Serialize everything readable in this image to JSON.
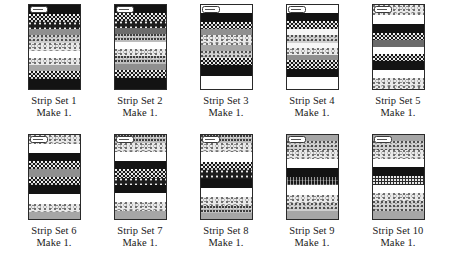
{
  "page": {
    "background_color": "#ffffff",
    "ink_color": "#1a1a1a",
    "columns": 5,
    "rows": 2
  },
  "strip_sets": [
    {
      "id": 1,
      "label": "Strip Set 1",
      "make": "Make 1.",
      "tag_icon": "fabric-tag-icon",
      "bands": [
        {
          "pattern": "solid-dark",
          "name": "black solid",
          "height_pct": 11,
          "color": "#131313"
        },
        {
          "pattern": "dot-dark",
          "name": "black dotted",
          "height_pct": 9,
          "color": "#171717"
        },
        {
          "pattern": "dot-dark2",
          "name": "black dotted",
          "height_pct": 8,
          "color": "#1d1d1d"
        },
        {
          "pattern": "gray-solid",
          "name": "medium gray solid",
          "height_pct": 8,
          "color": "#8f8f8f"
        },
        {
          "pattern": "stipple-mid",
          "name": "gray stipple",
          "height_pct": 9,
          "color": "#cfcfcf"
        },
        {
          "pattern": "stipple-light",
          "name": "light stipple",
          "height_pct": 10,
          "color": "#e9e9e9"
        },
        {
          "pattern": "white",
          "name": "white solid",
          "height_pct": 8,
          "color": "#ffffff"
        },
        {
          "pattern": "stipple-light",
          "name": "light stipple",
          "height_pct": 9,
          "color": "#e9e9e9"
        },
        {
          "pattern": "gray-mid",
          "name": "medium gray solid",
          "height_pct": 7,
          "color": "#a6a6a6"
        },
        {
          "pattern": "dot-dark",
          "name": "black dotted",
          "height_pct": 9,
          "color": "#171717"
        },
        {
          "pattern": "solid-dark",
          "name": "black solid",
          "height_pct": 12,
          "color": "#131313"
        }
      ]
    },
    {
      "id": 2,
      "label": "Strip Set 2",
      "make": "Make 1.",
      "tag_icon": "fabric-tag-icon",
      "bands": [
        {
          "pattern": "solid-dark",
          "name": "black solid",
          "height_pct": 10,
          "color": "#131313"
        },
        {
          "pattern": "dot-dark",
          "name": "black dotted",
          "height_pct": 9,
          "color": "#171717"
        },
        {
          "pattern": "dot-dark2",
          "name": "black dotted",
          "height_pct": 8,
          "color": "#1d1d1d"
        },
        {
          "pattern": "gray-dark",
          "name": "dark gray solid",
          "height_pct": 7,
          "color": "#6b6b6b"
        },
        {
          "pattern": "speckle-gray",
          "name": "gray speckle",
          "height_pct": 10,
          "color": "#bdbdbd"
        },
        {
          "pattern": "white",
          "name": "white solid",
          "height_pct": 8,
          "color": "#ffffff"
        },
        {
          "pattern": "stipple-light",
          "name": "light stipple",
          "height_pct": 9,
          "color": "#e9e9e9"
        },
        {
          "pattern": "speckle-gray",
          "name": "gray speckle",
          "height_pct": 9,
          "color": "#bdbdbd"
        },
        {
          "pattern": "gray-solid",
          "name": "medium gray solid",
          "height_pct": 7,
          "color": "#8f8f8f"
        },
        {
          "pattern": "dot-dark",
          "name": "black dotted",
          "height_pct": 10,
          "color": "#171717"
        },
        {
          "pattern": "solid-dark",
          "name": "black solid",
          "height_pct": 13,
          "color": "#131313"
        }
      ]
    },
    {
      "id": 3,
      "label": "Strip Set 3",
      "make": "Make 1.",
      "tag_icon": "fabric-tag-icon",
      "bands": [
        {
          "pattern": "white",
          "name": "white solid",
          "height_pct": 9,
          "color": "#ffffff"
        },
        {
          "pattern": "solid-dark",
          "name": "black solid",
          "height_pct": 11,
          "color": "#131313"
        },
        {
          "pattern": "dot-dark",
          "name": "black dotted",
          "height_pct": 9,
          "color": "#171717"
        },
        {
          "pattern": "gray-solid",
          "name": "medium gray solid",
          "height_pct": 7,
          "color": "#8f8f8f"
        },
        {
          "pattern": "stipple-light",
          "name": "light stipple",
          "height_pct": 12,
          "color": "#e9e9e9"
        },
        {
          "pattern": "gray-mid",
          "name": "medium gray solid",
          "height_pct": 7,
          "color": "#a6a6a6"
        },
        {
          "pattern": "stipple-mid",
          "name": "gray stipple",
          "height_pct": 8,
          "color": "#cfcfcf"
        },
        {
          "pattern": "dot-dark",
          "name": "black dotted",
          "height_pct": 9,
          "color": "#171717"
        },
        {
          "pattern": "solid-dark",
          "name": "black solid",
          "height_pct": 12,
          "color": "#131313"
        },
        {
          "pattern": "white",
          "name": "white solid",
          "height_pct": 16,
          "color": "#ffffff"
        }
      ]
    },
    {
      "id": 4,
      "label": "Strip Set 4",
      "make": "Make 1.",
      "tag_icon": "fabric-tag-icon",
      "bands": [
        {
          "pattern": "white",
          "name": "white solid",
          "height_pct": 9,
          "color": "#ffffff"
        },
        {
          "pattern": "solid-dark",
          "name": "black solid",
          "height_pct": 10,
          "color": "#131313"
        },
        {
          "pattern": "dot-dark",
          "name": "black dotted",
          "height_pct": 10,
          "color": "#171717"
        },
        {
          "pattern": "offwhite",
          "name": "off-white solid",
          "height_pct": 7,
          "color": "#f7f7f7"
        },
        {
          "pattern": "stipple-mid",
          "name": "gray stipple",
          "height_pct": 9,
          "color": "#cfcfcf"
        },
        {
          "pattern": "offwhite",
          "name": "off-white solid",
          "height_pct": 6,
          "color": "#f7f7f7"
        },
        {
          "pattern": "stipple-light",
          "name": "light stipple",
          "height_pct": 9,
          "color": "#e9e9e9"
        },
        {
          "pattern": "gray-solid",
          "name": "medium gray solid",
          "height_pct": 6,
          "color": "#8f8f8f"
        },
        {
          "pattern": "dot-dark",
          "name": "black dotted",
          "height_pct": 10,
          "color": "#171717"
        },
        {
          "pattern": "solid-dark",
          "name": "black solid",
          "height_pct": 10,
          "color": "#131313"
        },
        {
          "pattern": "white",
          "name": "white solid",
          "height_pct": 14,
          "color": "#ffffff"
        }
      ]
    },
    {
      "id": 5,
      "label": "Strip Set 5",
      "make": "Make 1.",
      "tag_icon": "fabric-tag-icon",
      "bands": [
        {
          "pattern": "stipple-light",
          "name": "light stipple",
          "height_pct": 12,
          "color": "#e9e9e9"
        },
        {
          "pattern": "white",
          "name": "white solid",
          "height_pct": 11,
          "color": "#ffffff"
        },
        {
          "pattern": "solid-dark",
          "name": "black solid",
          "height_pct": 10,
          "color": "#131313"
        },
        {
          "pattern": "dot-dark",
          "name": "black dotted",
          "height_pct": 9,
          "color": "#171717"
        },
        {
          "pattern": "gray-dark",
          "name": "dark gray solid",
          "height_pct": 8,
          "color": "#6b6b6b"
        },
        {
          "pattern": "white",
          "name": "white solid",
          "height_pct": 8,
          "color": "#ffffff"
        },
        {
          "pattern": "dot-dark",
          "name": "black dotted",
          "height_pct": 9,
          "color": "#171717"
        },
        {
          "pattern": "solid-dark",
          "name": "black solid",
          "height_pct": 10,
          "color": "#131313"
        },
        {
          "pattern": "white",
          "name": "white solid",
          "height_pct": 10,
          "color": "#ffffff"
        },
        {
          "pattern": "stipple-light",
          "name": "light stipple",
          "height_pct": 13,
          "color": "#e9e9e9"
        }
      ]
    },
    {
      "id": 6,
      "label": "Strip Set 6",
      "make": "Make 1.",
      "tag_icon": "fabric-tag-icon",
      "bands": [
        {
          "pattern": "stipple-light",
          "name": "light stipple",
          "height_pct": 11,
          "color": "#e9e9e9"
        },
        {
          "pattern": "white",
          "name": "white solid",
          "height_pct": 11,
          "color": "#ffffff"
        },
        {
          "pattern": "solid-dark",
          "name": "black solid",
          "height_pct": 9,
          "color": "#131313"
        },
        {
          "pattern": "dot-dark",
          "name": "black dotted",
          "height_pct": 10,
          "color": "#171717"
        },
        {
          "pattern": "gray-solid",
          "name": "medium gray solid",
          "height_pct": 9,
          "color": "#8f8f8f"
        },
        {
          "pattern": "dot-dark",
          "name": "black dotted",
          "height_pct": 10,
          "color": "#171717"
        },
        {
          "pattern": "solid-dark",
          "name": "black solid",
          "height_pct": 10,
          "color": "#131313"
        },
        {
          "pattern": "white",
          "name": "white solid",
          "height_pct": 12,
          "color": "#ffffff"
        },
        {
          "pattern": "stipple-light",
          "name": "light stipple",
          "height_pct": 10,
          "color": "#e9e9e9"
        },
        {
          "pattern": "gray-mid",
          "name": "medium gray solid",
          "height_pct": 8,
          "color": "#a6a6a6"
        }
      ]
    },
    {
      "id": 7,
      "label": "Strip Set 7",
      "make": "Make 1.",
      "tag_icon": "fabric-tag-icon",
      "bands": [
        {
          "pattern": "speckle-gray",
          "name": "gray speckle",
          "height_pct": 10,
          "color": "#bdbdbd"
        },
        {
          "pattern": "stipple-light",
          "name": "light stipple",
          "height_pct": 10,
          "color": "#e9e9e9"
        },
        {
          "pattern": "white",
          "name": "white solid",
          "height_pct": 11,
          "color": "#ffffff"
        },
        {
          "pattern": "solid-dark",
          "name": "black solid",
          "height_pct": 10,
          "color": "#131313"
        },
        {
          "pattern": "dot-dark",
          "name": "black dotted",
          "height_pct": 10,
          "color": "#171717"
        },
        {
          "pattern": "dot-dark2",
          "name": "black dotted",
          "height_pct": 9,
          "color": "#1d1d1d"
        },
        {
          "pattern": "solid-dark",
          "name": "black solid",
          "height_pct": 9,
          "color": "#131313"
        },
        {
          "pattern": "white",
          "name": "white solid",
          "height_pct": 11,
          "color": "#ffffff"
        },
        {
          "pattern": "stipple-light",
          "name": "light stipple",
          "height_pct": 11,
          "color": "#e9e9e9"
        },
        {
          "pattern": "gray-mid",
          "name": "medium gray solid",
          "height_pct": 9,
          "color": "#a6a6a6"
        }
      ]
    },
    {
      "id": 8,
      "label": "Strip Set 8",
      "make": "Make 1.",
      "tag_icon": "fabric-tag-icon",
      "bands": [
        {
          "pattern": "speckle-gray",
          "name": "gray speckle",
          "height_pct": 10,
          "color": "#bdbdbd"
        },
        {
          "pattern": "stipple-light",
          "name": "light stipple",
          "height_pct": 10,
          "color": "#e9e9e9"
        },
        {
          "pattern": "white",
          "name": "white solid",
          "height_pct": 12,
          "color": "#ffffff"
        },
        {
          "pattern": "dot-dark",
          "name": "black dotted",
          "height_pct": 10,
          "color": "#171717"
        },
        {
          "pattern": "dot-dark2",
          "name": "black dotted",
          "height_pct": 10,
          "color": "#1d1d1d"
        },
        {
          "pattern": "solid-dark",
          "name": "black solid",
          "height_pct": 11,
          "color": "#131313"
        },
        {
          "pattern": "white",
          "name": "white solid",
          "height_pct": 11,
          "color": "#ffffff"
        },
        {
          "pattern": "stipple-light",
          "name": "light stipple",
          "height_pct": 10,
          "color": "#e9e9e9"
        },
        {
          "pattern": "speckle-gray",
          "name": "gray speckle",
          "height_pct": 9,
          "color": "#bdbdbd"
        },
        {
          "pattern": "gray-mid",
          "name": "medium gray solid",
          "height_pct": 7,
          "color": "#a6a6a6"
        }
      ]
    },
    {
      "id": 9,
      "label": "Strip Set 9",
      "make": "Make 1.",
      "tag_icon": "fabric-tag-icon",
      "bands": [
        {
          "pattern": "gray-mid",
          "name": "medium gray solid",
          "height_pct": 7,
          "color": "#a6a6a6"
        },
        {
          "pattern": "stipple-mid",
          "name": "gray stipple",
          "height_pct": 11,
          "color": "#cfcfcf"
        },
        {
          "pattern": "stipple-light",
          "name": "light stipple",
          "height_pct": 10,
          "color": "#e9e9e9"
        },
        {
          "pattern": "white",
          "name": "white solid",
          "height_pct": 11,
          "color": "#ffffff"
        },
        {
          "pattern": "solid-dark",
          "name": "black solid",
          "height_pct": 11,
          "color": "#131313"
        },
        {
          "pattern": "hatch-dark",
          "name": "black crosshatch",
          "height_pct": 10,
          "color": "#1a1a1a"
        },
        {
          "pattern": "white",
          "name": "white solid",
          "height_pct": 11,
          "color": "#ffffff"
        },
        {
          "pattern": "stipple-light",
          "name": "light stipple",
          "height_pct": 10,
          "color": "#e9e9e9"
        },
        {
          "pattern": "stipple-mid",
          "name": "gray stipple",
          "height_pct": 10,
          "color": "#cfcfcf"
        },
        {
          "pattern": "gray-mid",
          "name": "medium gray solid",
          "height_pct": 9,
          "color": "#a6a6a6"
        }
      ]
    },
    {
      "id": 10,
      "label": "Strip Set 10",
      "make": "Make 1.",
      "tag_icon": "fabric-tag-icon",
      "bands": [
        {
          "pattern": "gray-mid",
          "name": "medium gray solid",
          "height_pct": 7,
          "color": "#a6a6a6"
        },
        {
          "pattern": "stipple-mid",
          "name": "gray stipple",
          "height_pct": 11,
          "color": "#cfcfcf"
        },
        {
          "pattern": "stipple-light",
          "name": "light stipple",
          "height_pct": 11,
          "color": "#e9e9e9"
        },
        {
          "pattern": "white",
          "name": "white solid",
          "height_pct": 9,
          "color": "#ffffff"
        },
        {
          "pattern": "solid-dark",
          "name": "black solid",
          "height_pct": 11,
          "color": "#131313"
        },
        {
          "pattern": "dense-dot",
          "name": "black dense dot",
          "height_pct": 10,
          "color": "#2a2a2a"
        },
        {
          "pattern": "white",
          "name": "white solid",
          "height_pct": 10,
          "color": "#ffffff"
        },
        {
          "pattern": "stipple-light",
          "name": "light stipple",
          "height_pct": 10,
          "color": "#e9e9e9"
        },
        {
          "pattern": "stipple-mid",
          "name": "gray stipple",
          "height_pct": 11,
          "color": "#cfcfcf"
        },
        {
          "pattern": "gray-mid",
          "name": "medium gray solid",
          "height_pct": 10,
          "color": "#a6a6a6"
        }
      ]
    }
  ]
}
